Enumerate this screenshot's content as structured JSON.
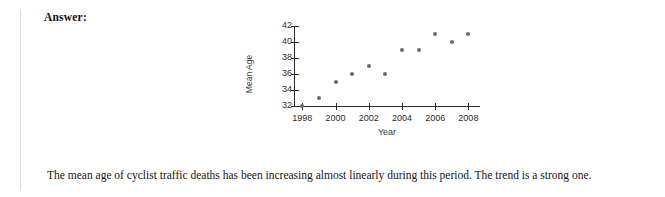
{
  "page": {
    "answer_label": "Answer:",
    "conclusion": "The mean age of cyclist traffic deaths has been increasing almost linearly during this period. The trend is a strong one."
  },
  "colors": {
    "point": "#6b6b6b",
    "axis": "#2a2a2a",
    "text": "#161616",
    "rule": "#d8d8d8",
    "background": "#ffffff"
  },
  "chart_data": {
    "type": "scatter",
    "title": "",
    "xlabel": "Year",
    "ylabel": "Mean Age",
    "x": [
      1998,
      1999,
      2000,
      2001,
      2002,
      2003,
      2004,
      2005,
      2006,
      2007,
      2008
    ],
    "values": [
      32,
      33,
      35,
      36,
      37,
      36,
      39,
      39,
      41,
      40,
      41
    ],
    "xlim": [
      1997.5,
      2008.7
    ],
    "ylim": [
      32,
      42
    ],
    "xticks": [
      1998,
      2000,
      2002,
      2004,
      2006,
      2008
    ],
    "xticklabels": [
      "1998",
      "2000",
      "2002",
      "2004",
      "2006",
      "2008"
    ],
    "yticks": [
      32,
      34,
      36,
      38,
      40,
      42
    ],
    "yticklabels": [
      "42",
      "40",
      "38",
      "36",
      "34",
      "32"
    ],
    "grid": false,
    "legend": false,
    "marker": "circle"
  }
}
